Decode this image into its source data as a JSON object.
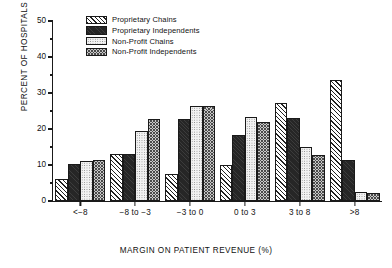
{
  "chart_data": {
    "type": "bar",
    "title": "",
    "xlabel": "MARGIN ON PATIENT REVENUE (%)",
    "ylabel": "PERCENT OF HOSPITALS",
    "ylim": [
      0,
      50
    ],
    "ytick_labels": [
      "0",
      "10",
      "20",
      "30",
      "40",
      "50"
    ],
    "ytick_values": [
      0,
      10,
      20,
      30,
      40,
      50
    ],
    "yminor_values": [
      5,
      15,
      25,
      35,
      45
    ],
    "grid": false,
    "legend_position": "top-left-inside",
    "categories": [
      "<−8",
      "−8 to −3",
      "−3 to 0",
      "0 to 3",
      "3 to 8",
      ">8"
    ],
    "series": [
      {
        "name": "Proprietary Chains",
        "pattern": "diagonal-hatch",
        "color": "#ffffff",
        "values": [
          6.2,
          13.1,
          7.5,
          9.9,
          27.3,
          33.6
        ]
      },
      {
        "name": "Proprietary Independents",
        "pattern": "solid-dark",
        "color": "#262626",
        "values": [
          10.2,
          13.1,
          22.8,
          18.2,
          23.1,
          11.3
        ]
      },
      {
        "name": "Non-Profit Chains",
        "pattern": "light-dotted",
        "color": "#f2f2f2",
        "values": [
          11.2,
          19.4,
          26.5,
          23.3,
          15.0,
          2.6
        ]
      },
      {
        "name": "Non-Profit Independents",
        "pattern": "dense-crosshatch",
        "color": "#c9c9c9",
        "values": [
          11.3,
          22.7,
          26.5,
          22.0,
          12.8,
          2.2
        ]
      }
    ]
  }
}
